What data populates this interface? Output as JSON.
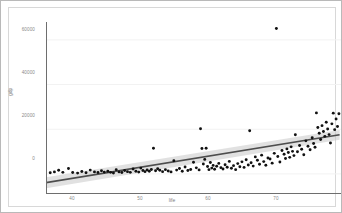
{
  "chart_data": {
    "type": "scatter",
    "title": "",
    "xlabel": "life",
    "ylabel": "gdp",
    "xlim": [
      36.0,
      78.0
    ],
    "ylim": [
      -9000,
      68000
    ],
    "xticks": [
      40,
      50,
      60,
      70
    ],
    "yticks": [
      0,
      20000,
      40000,
      60000
    ],
    "xtick_labels": [
      "40",
      "50",
      "60",
      "70"
    ],
    "ytick_labels": [
      "0",
      "20000",
      "40000",
      "60000"
    ],
    "grid": "horizontal-faint",
    "legend": "none",
    "series": [
      {
        "name": "countries",
        "marker": "filled-circle",
        "color": "#111111",
        "points": [
          [
            36.6,
            500
          ],
          [
            37.2,
            900
          ],
          [
            37.8,
            1600
          ],
          [
            38.4,
            700
          ],
          [
            39.2,
            2400
          ],
          [
            39.8,
            600
          ],
          [
            40.5,
            350
          ],
          [
            41.1,
            1100
          ],
          [
            41.7,
            500
          ],
          [
            42.3,
            1700
          ],
          [
            42.9,
            900
          ],
          [
            43.4,
            600
          ],
          [
            43.9,
            1400
          ],
          [
            44.3,
            800
          ],
          [
            44.8,
            1200
          ],
          [
            45.2,
            700
          ],
          [
            45.6,
            400
          ],
          [
            46.0,
            1900
          ],
          [
            46.4,
            900
          ],
          [
            46.8,
            600
          ],
          [
            47.2,
            1500
          ],
          [
            47.6,
            1000
          ],
          [
            48.0,
            700
          ],
          [
            48.4,
            2200
          ],
          [
            48.8,
            1200
          ],
          [
            49.2,
            800
          ],
          [
            49.5,
            2600
          ],
          [
            49.8,
            1500
          ],
          [
            50.1,
            1000
          ],
          [
            50.4,
            1800
          ],
          [
            50.7,
            1200
          ],
          [
            51.0,
            2000
          ],
          [
            51.3,
            11500
          ],
          [
            51.6,
            1400
          ],
          [
            51.9,
            2300
          ],
          [
            52.2,
            1600
          ],
          [
            52.6,
            1000
          ],
          [
            53.0,
            1900
          ],
          [
            53.4,
            1300
          ],
          [
            53.8,
            900
          ],
          [
            54.2,
            5900
          ],
          [
            54.6,
            1700
          ],
          [
            55.0,
            2400
          ],
          [
            55.4,
            1200
          ],
          [
            55.8,
            3100
          ],
          [
            56.2,
            1500
          ],
          [
            56.6,
            2000
          ],
          [
            57.0,
            5200
          ],
          [
            57.4,
            2700
          ],
          [
            57.8,
            1800
          ],
          [
            58.0,
            20200
          ],
          [
            58.2,
            11400
          ],
          [
            58.4,
            4400
          ],
          [
            58.6,
            6500
          ],
          [
            58.8,
            11500
          ],
          [
            59.0,
            3300
          ],
          [
            59.2,
            1900
          ],
          [
            59.4,
            5100
          ],
          [
            59.6,
            2600
          ],
          [
            59.8,
            3800
          ],
          [
            60.0,
            2100
          ],
          [
            60.3,
            3400
          ],
          [
            60.6,
            4700
          ],
          [
            60.9,
            2800
          ],
          [
            61.2,
            2200
          ],
          [
            61.5,
            4100
          ],
          [
            61.8,
            3000
          ],
          [
            62.1,
            5600
          ],
          [
            62.4,
            2500
          ],
          [
            62.7,
            3700
          ],
          [
            63.0,
            1900
          ],
          [
            63.3,
            4600
          ],
          [
            63.6,
            3200
          ],
          [
            63.9,
            5400
          ],
          [
            64.2,
            2900
          ],
          [
            64.5,
            6300
          ],
          [
            64.8,
            4000
          ],
          [
            65.0,
            19300
          ],
          [
            65.2,
            5000
          ],
          [
            65.5,
            3500
          ],
          [
            65.8,
            7600
          ],
          [
            66.1,
            6100
          ],
          [
            66.4,
            4300
          ],
          [
            66.7,
            8400
          ],
          [
            67.0,
            5500
          ],
          [
            67.3,
            3900
          ],
          [
            67.6,
            7100
          ],
          [
            67.9,
            6700
          ],
          [
            68.2,
            4800
          ],
          [
            68.5,
            9200
          ],
          [
            68.8,
            65100
          ],
          [
            69.0,
            7800
          ],
          [
            69.3,
            5300
          ],
          [
            69.6,
            10500
          ],
          [
            69.9,
            8800
          ],
          [
            70.1,
            6900
          ],
          [
            70.3,
            11200
          ],
          [
            70.5,
            9600
          ],
          [
            70.7,
            7400
          ],
          [
            70.9,
            12100
          ],
          [
            71.1,
            10100
          ],
          [
            71.3,
            8200
          ],
          [
            71.5,
            17500
          ],
          [
            71.8,
            9900
          ],
          [
            72.1,
            12700
          ],
          [
            72.4,
            11000
          ],
          [
            72.7,
            8600
          ],
          [
            73.0,
            14800
          ],
          [
            73.3,
            12400
          ],
          [
            73.6,
            10800
          ],
          [
            73.9,
            16200
          ],
          [
            74.1,
            13600
          ],
          [
            74.3,
            11900
          ],
          [
            74.5,
            27300
          ],
          [
            74.7,
            20800
          ],
          [
            74.9,
            18200
          ],
          [
            75.1,
            15400
          ],
          [
            75.3,
            21600
          ],
          [
            75.5,
            19000
          ],
          [
            75.7,
            16800
          ],
          [
            75.9,
            23100
          ],
          [
            76.1,
            20100
          ],
          [
            76.3,
            17600
          ],
          [
            76.5,
            13800
          ],
          [
            76.7,
            22400
          ],
          [
            76.9,
            27200
          ],
          [
            77.1,
            19800
          ],
          [
            77.3,
            24600
          ],
          [
            77.5,
            21200
          ],
          [
            77.7,
            26900
          ]
        ]
      }
    ],
    "fit": {
      "name": "linear regression",
      "type": "line",
      "color": "#4d4d4d",
      "x_start": 36.0,
      "x_end": 77.8,
      "y_start": -3900,
      "y_end": 17500,
      "confidence_band": {
        "color": "#c9c9c9",
        "lower_start": -6400,
        "upper_start": -1500,
        "lower_end": 15300,
        "upper_end": 19700
      }
    }
  }
}
